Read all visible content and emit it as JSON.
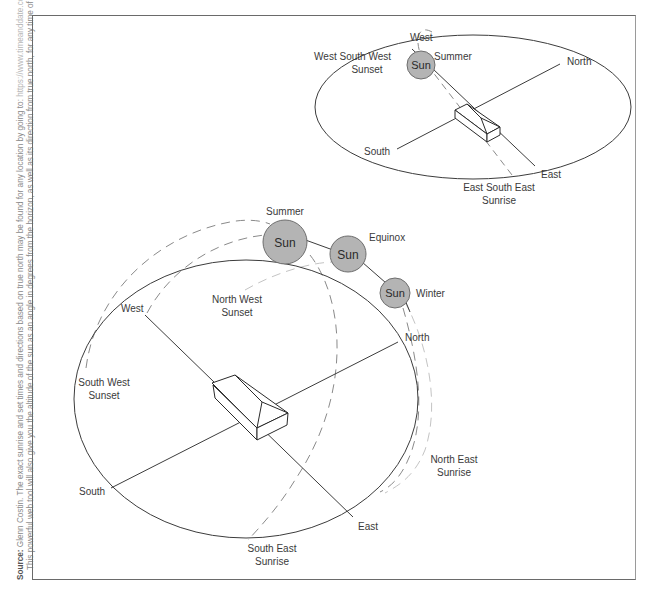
{
  "source_note": {
    "label": "Source:",
    "line1_text": "Glenn Costin. The exact sunrise and set times and directions based on true north may be found for any location by going to:",
    "line1_link": "https://www.timeanddate.com/sun",
    "line2_text": "This powerful web tool will also give you the altitude of the sun as an angle in degrees from the horizon, as well as its direction from true north, for any time of the day."
  },
  "colors": {
    "sun_fill": "#b4b4b4",
    "sun_stroke": "#6e6e6e",
    "line": "#3c3c3c",
    "dashed": "#8a8a8a",
    "light_dashed": "#c4c4c4",
    "frame": "#6a6a6a"
  },
  "large_diagram": {
    "compass": {
      "west": "West",
      "north": "North",
      "south": "South",
      "east": "East"
    },
    "suns": [
      {
        "label": "Sun",
        "season": "Summer"
      },
      {
        "label": "Sun",
        "season": "Equinox"
      },
      {
        "label": "Sun",
        "season": "Winter"
      }
    ],
    "events": {
      "north_west_sunset": [
        "North West",
        "Sunset"
      ],
      "south_west_sunset": [
        "South West",
        "Sunset"
      ],
      "north_east_sunrise": [
        "North East",
        "Sunrise"
      ],
      "south_east_sunrise": [
        "South East",
        "Sunrise"
      ]
    }
  },
  "small_diagram": {
    "compass": {
      "west": "West",
      "north": "North",
      "south": "South",
      "east": "East"
    },
    "sun": {
      "label": "Sun",
      "season": "Summer"
    },
    "events": {
      "wsw_sunset": [
        "West South West",
        "Sunset"
      ],
      "ese_sunrise": [
        "East South East",
        "Sunrise"
      ]
    }
  }
}
